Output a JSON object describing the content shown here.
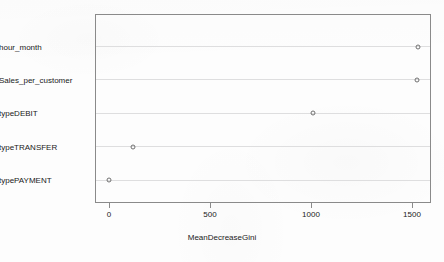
{
  "chart_data": {
    "type": "scatter",
    "subtype": "dotchart",
    "title": "",
    "xlabel": "MeanDecreaseGini",
    "ylabel": "",
    "xlim": [
      -30,
      1630
    ],
    "xticks": [
      0,
      500,
      1000,
      1500
    ],
    "xtick_labels": [
      "0",
      "500",
      "1000",
      "1500"
    ],
    "grid": "horizontal",
    "legend": "none",
    "marker": "open-circle",
    "categories": [
      "typePAYMENT",
      "typeTRANSFER",
      "typeDEBIT",
      "Sales_per_customer",
      "hour_month"
    ],
    "values": [
      2,
      118,
      1010,
      1525,
      1530
    ],
    "points": [
      {
        "category": "hour_month",
        "value": 1530
      },
      {
        "category": "Sales_per_customer",
        "value": 1525
      },
      {
        "category": "typeDEBIT",
        "value": 1010
      },
      {
        "category": "typeTRANSFER",
        "value": 118
      },
      {
        "category": "typePAYMENT",
        "value": 2
      }
    ],
    "colors": {
      "marker_stroke": "#707070",
      "gridline": "#dededf",
      "axis": "#8a8a8a",
      "text": "#1a1a1a",
      "background": "#fdfdfd"
    }
  }
}
